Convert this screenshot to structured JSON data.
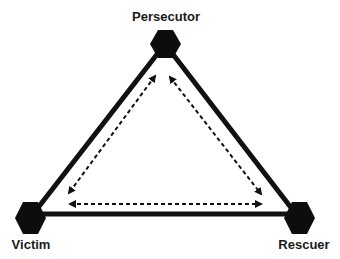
{
  "diagram": {
    "nodes": [
      {
        "id": "persecutor",
        "label": "Persecutor",
        "x": 165,
        "y": 44,
        "label_x": 166,
        "label_y": 10
      },
      {
        "id": "victim",
        "label": "Victim",
        "x": 30,
        "y": 218,
        "label_x": 31,
        "label_y": 238
      },
      {
        "id": "rescuer",
        "label": "Rescuer",
        "x": 299,
        "y": 218,
        "label_x": 304,
        "label_y": 238
      }
    ],
    "edges": [
      {
        "from": "persecutor",
        "to": "victim",
        "style": "solid"
      },
      {
        "from": "victim",
        "to": "rescuer",
        "style": "solid"
      },
      {
        "from": "rescuer",
        "to": "persecutor",
        "style": "solid"
      }
    ],
    "arrows": [
      {
        "between": [
          "persecutor",
          "victim"
        ],
        "style": "dashed",
        "direction": "bidirectional"
      },
      {
        "between": [
          "victim",
          "rescuer"
        ],
        "style": "dashed",
        "direction": "bidirectional"
      },
      {
        "between": [
          "rescuer",
          "persecutor"
        ],
        "style": "dashed",
        "direction": "bidirectional"
      }
    ],
    "colors": {
      "line": "#111111",
      "node": "#0d0d0d",
      "background": "#ffffff"
    }
  }
}
